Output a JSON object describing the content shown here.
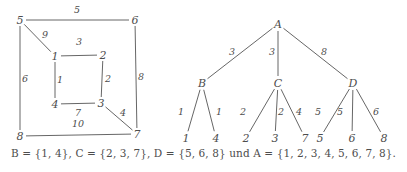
{
  "figure": {
    "background_color": "#ffffff",
    "stroke_color": "#555555",
    "text_color": "#4d4d4d",
    "caption": "B = {1, 4}, C = {2, 3, 7}, D = {5, 6, 8} und A = {1, 2, 3, 4, 5, 6, 7, 8}."
  },
  "graph": {
    "title": "weighted-graph",
    "nodes": [
      {
        "id": "n5",
        "label": "5",
        "x": 20,
        "y": 20
      },
      {
        "id": "n6",
        "label": "6",
        "x": 135,
        "y": 20
      },
      {
        "id": "n8",
        "label": "8",
        "x": 20,
        "y": 136
      },
      {
        "id": "n7",
        "label": "7",
        "x": 137,
        "y": 134
      },
      {
        "id": "i1",
        "label": "1",
        "x": 55,
        "y": 56
      },
      {
        "id": "i2",
        "label": "2",
        "x": 103,
        "y": 55
      },
      {
        "id": "i4",
        "label": "4",
        "x": 55,
        "y": 104
      },
      {
        "id": "i3",
        "label": "3",
        "x": 101,
        "y": 103
      }
    ],
    "edges": [
      {
        "from": "n5",
        "to": "n6",
        "weight": "5",
        "lx": 77,
        "ly": 13
      },
      {
        "from": "n5",
        "to": "i1",
        "weight": "9",
        "lx": 45,
        "ly": 38
      },
      {
        "from": "n5",
        "to": "n8",
        "weight": "6",
        "lx": 25,
        "ly": 82
      },
      {
        "from": "n6",
        "to": "n7",
        "weight": "8",
        "lx": 141,
        "ly": 80
      },
      {
        "from": "i1",
        "to": "i2",
        "weight": "3",
        "lx": 79,
        "ly": 45
      },
      {
        "from": "i1",
        "to": "i4",
        "weight": "1",
        "lx": 60,
        "ly": 83
      },
      {
        "from": "i2",
        "to": "i3",
        "weight": "2",
        "lx": 108,
        "ly": 82
      },
      {
        "from": "i4",
        "to": "i3",
        "weight": "7",
        "lx": 78,
        "ly": 116
      },
      {
        "from": "i3",
        "to": "n7",
        "weight": "4",
        "lx": 123,
        "ly": 116
      },
      {
        "from": "n8",
        "to": "n7",
        "weight": "10",
        "lx": 78,
        "ly": 127
      }
    ]
  },
  "tree": {
    "title": "cluster-tree",
    "nodes": [
      {
        "id": "A",
        "label": "A",
        "x": 278,
        "y": 24,
        "level": 0
      },
      {
        "id": "B",
        "label": "B",
        "x": 202,
        "y": 83,
        "level": 1
      },
      {
        "id": "C",
        "label": "C",
        "x": 278,
        "y": 83,
        "level": 1
      },
      {
        "id": "D",
        "label": "D",
        "x": 353,
        "y": 83,
        "level": 1
      },
      {
        "id": "L1",
        "label": "1",
        "x": 186,
        "y": 138,
        "level": 2
      },
      {
        "id": "L4",
        "label": "4",
        "x": 216,
        "y": 138,
        "level": 2
      },
      {
        "id": "L2",
        "label": "2",
        "x": 246,
        "y": 138,
        "level": 2
      },
      {
        "id": "L3",
        "label": "3",
        "x": 275,
        "y": 138,
        "level": 2
      },
      {
        "id": "L7",
        "label": "7",
        "x": 305,
        "y": 138,
        "level": 2
      },
      {
        "id": "L5",
        "label": "5",
        "x": 320,
        "y": 138,
        "level": 2
      },
      {
        "id": "L6",
        "label": "6",
        "x": 352,
        "y": 138,
        "level": 2
      },
      {
        "id": "L8",
        "label": "8",
        "x": 384,
        "y": 138,
        "level": 2
      }
    ],
    "edges": [
      {
        "from": "A",
        "to": "B",
        "weight": "3",
        "lx": 232,
        "ly": 55
      },
      {
        "from": "A",
        "to": "C",
        "weight": "3",
        "lx": 272,
        "ly": 55
      },
      {
        "from": "A",
        "to": "D",
        "weight": "8",
        "lx": 324,
        "ly": 55
      },
      {
        "from": "B",
        "to": "L1",
        "weight": "1",
        "lx": 181,
        "ly": 115
      },
      {
        "from": "B",
        "to": "L4",
        "weight": "1",
        "lx": 219,
        "ly": 115
      },
      {
        "from": "C",
        "to": "L2",
        "weight": "2",
        "lx": 243,
        "ly": 115
      },
      {
        "from": "C",
        "to": "L3",
        "weight": "2",
        "lx": 281,
        "ly": 115
      },
      {
        "from": "C",
        "to": "L7",
        "weight": "4",
        "lx": 299,
        "ly": 115
      },
      {
        "from": "D",
        "to": "L5",
        "weight": "5",
        "lx": 318,
        "ly": 115
      },
      {
        "from": "D",
        "to": "L6",
        "weight": "5",
        "lx": 340,
        "ly": 115
      },
      {
        "from": "D",
        "to": "L8",
        "weight": "6",
        "lx": 376,
        "ly": 115
      }
    ]
  }
}
